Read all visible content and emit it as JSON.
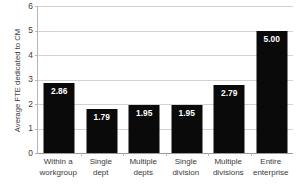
{
  "chart_data": {
    "type": "bar",
    "title": "",
    "xlabel": "",
    "ylabel": "Average FTE dedicated to CM",
    "ylim": [
      0,
      6
    ],
    "ytick_values": [
      6,
      5,
      4,
      3,
      2,
      1,
      0
    ],
    "ytick_labels": [
      "6",
      "5",
      "4",
      "3",
      "2",
      "1",
      "0"
    ],
    "grid": true,
    "legend": "none",
    "bar_color": "#0a0a0a",
    "value_label_color": "#ffffff",
    "categories": [
      "Within a workgroup",
      "Single dept",
      "Multiple depts",
      "Single division",
      "Multiple divisions",
      "Entire enterprise"
    ],
    "category_lines": [
      [
        "Within a",
        "workgroup"
      ],
      [
        "Single",
        "dept"
      ],
      [
        "Multiple",
        "depts"
      ],
      [
        "Single",
        "division"
      ],
      [
        "Multiple",
        "divisions"
      ],
      [
        "Entire",
        "enterprise"
      ]
    ],
    "values": [
      2.86,
      1.79,
      1.95,
      1.95,
      2.79,
      5.0
    ],
    "value_labels": [
      "2.86",
      "1.79",
      "1.95",
      "1.95",
      "2.79",
      "5.00"
    ]
  }
}
